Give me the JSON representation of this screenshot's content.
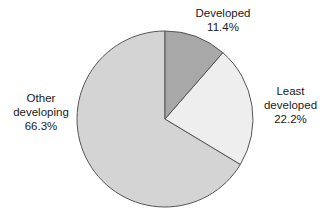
{
  "chart_data": {
    "type": "pie",
    "title": "",
    "subtitle": "",
    "xlabel": "",
    "ylabel": "",
    "legend_position": "none",
    "grid": false,
    "units": "percent",
    "start_angle_deg": 0,
    "direction": "clockwise",
    "categories": [
      "Developed",
      "Least developed",
      "Other developing"
    ],
    "values": [
      11.4,
      22.2,
      66.3
    ],
    "slices": [
      {
        "name": "Developed",
        "label_lines": [
          "Developed",
          "11.4%"
        ],
        "value": 11.4,
        "value_text": "11.4%",
        "color": "#a8a8a8",
        "start_angle_deg": 0,
        "end_angle_deg": 41.04
      },
      {
        "name": "Least developed",
        "label_lines": [
          "Least",
          "developed",
          "22.2%"
        ],
        "value": 22.2,
        "value_text": "22.2%",
        "color": "#eeeeee",
        "start_angle_deg": 41.04,
        "end_angle_deg": 120.96
      },
      {
        "name": "Other developing",
        "label_lines": [
          "Other",
          "developing",
          "66.3%"
        ],
        "value": 66.3,
        "value_text": "66.3%",
        "color": "#d4d4d4",
        "start_angle_deg": 120.96,
        "end_angle_deg": 360
      }
    ]
  },
  "labels": {
    "developed": {
      "line1": "Developed",
      "line2": "11.4%"
    },
    "least_developed": {
      "line1": "Least",
      "line2": "developed",
      "line3": "22.2%"
    },
    "other_developing": {
      "line1": "Other",
      "line2": "developing",
      "line3": "66.3%"
    }
  },
  "colors": {
    "background": "#ffffff",
    "stroke": "#555555",
    "text": "#1a1a1a",
    "slice_developed": "#a8a8a8",
    "slice_least_developed": "#eeeeee",
    "slice_other_developing": "#d4d4d4"
  },
  "geometry": {
    "center_x": 165,
    "center_y": 119,
    "radius": 88
  }
}
